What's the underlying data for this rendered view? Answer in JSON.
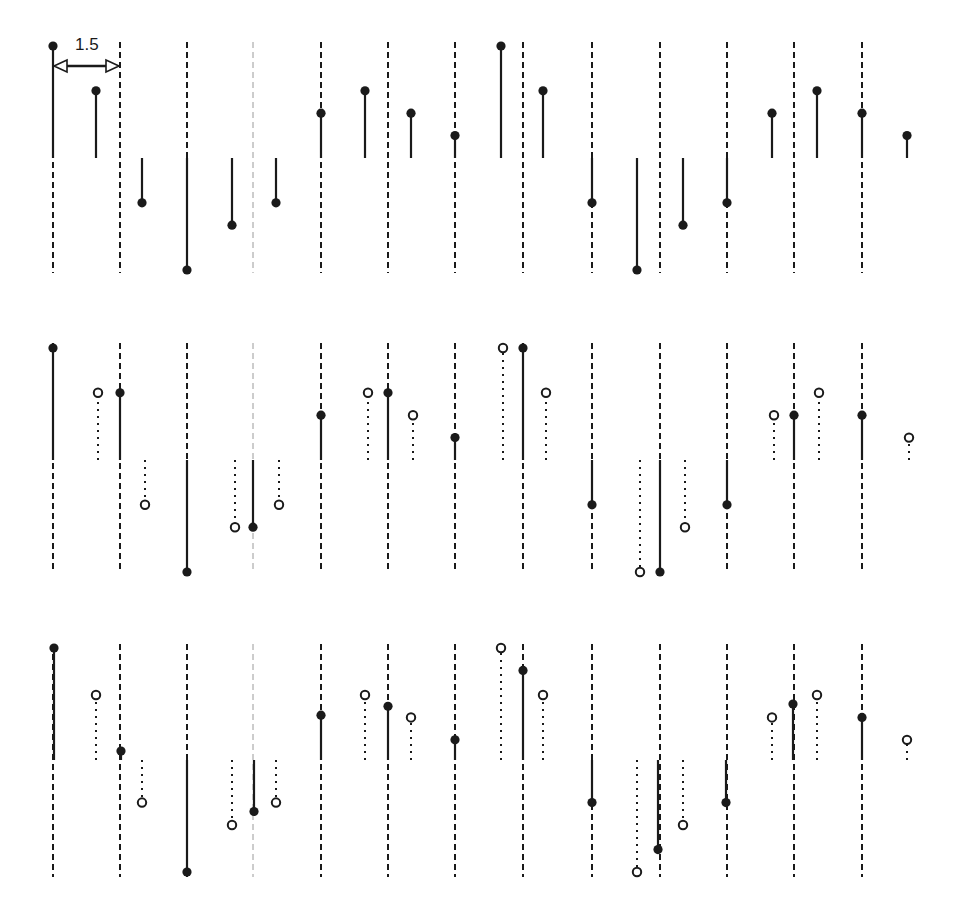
{
  "annotation": {
    "label": "1.5",
    "arrow": {
      "x1": 53,
      "x2": 120,
      "y": 66
    }
  },
  "layout": {
    "unit_px": 22.4,
    "stroke_color": "#1a1a1a",
    "grid_x": [
      53,
      120,
      187,
      253,
      321,
      388,
      455,
      523,
      592,
      660,
      727,
      794,
      862
    ],
    "light_grid_index": 3,
    "panels": [
      {
        "baseline": 158,
        "grid_top": 42,
        "grid_bottom": 273
      },
      {
        "baseline": 460,
        "grid_top": 343,
        "grid_bottom": 573
      },
      {
        "baseline": 760,
        "grid_top": 644,
        "grid_bottom": 877
      }
    ]
  },
  "chart_data": {
    "type": "stem",
    "title": "",
    "x_spacing_label": "1.5",
    "panels": [
      {
        "name": "panel-1",
        "filled": [
          {
            "x": 53,
            "v": 5
          },
          {
            "x": 96,
            "v": 3
          },
          {
            "x": 142,
            "v": -2
          },
          {
            "x": 187,
            "v": -5
          },
          {
            "x": 232,
            "v": -3
          },
          {
            "x": 276,
            "v": -2
          },
          {
            "x": 321,
            "v": 2
          },
          {
            "x": 365,
            "v": 3
          },
          {
            "x": 411,
            "v": 2
          },
          {
            "x": 455,
            "v": 1
          },
          {
            "x": 501,
            "v": 5
          },
          {
            "x": 543,
            "v": 3
          },
          {
            "x": 592,
            "v": -2
          },
          {
            "x": 637,
            "v": -5
          },
          {
            "x": 683,
            "v": -3
          },
          {
            "x": 727,
            "v": -2
          },
          {
            "x": 772,
            "v": 2
          },
          {
            "x": 817,
            "v": 3
          },
          {
            "x": 862,
            "v": 2
          },
          {
            "x": 907,
            "v": 1
          }
        ],
        "hollow": []
      },
      {
        "name": "panel-2",
        "filled": [
          {
            "x": 53,
            "v": 5
          },
          {
            "x": 120,
            "v": 3
          },
          {
            "x": 187,
            "v": -5
          },
          {
            "x": 253,
            "v": -3
          },
          {
            "x": 321,
            "v": 2
          },
          {
            "x": 388,
            "v": 3
          },
          {
            "x": 455,
            "v": 1
          },
          {
            "x": 523,
            "v": 5
          },
          {
            "x": 592,
            "v": -2
          },
          {
            "x": 660,
            "v": -5
          },
          {
            "x": 727,
            "v": -2
          },
          {
            "x": 794,
            "v": 2
          },
          {
            "x": 862,
            "v": 2
          }
        ],
        "hollow": [
          {
            "x": 98,
            "v": 3
          },
          {
            "x": 145,
            "v": -2
          },
          {
            "x": 235,
            "v": -3
          },
          {
            "x": 279,
            "v": -2
          },
          {
            "x": 368,
            "v": 3
          },
          {
            "x": 413,
            "v": 2
          },
          {
            "x": 503,
            "v": 5
          },
          {
            "x": 546,
            "v": 3
          },
          {
            "x": 640,
            "v": -5
          },
          {
            "x": 685,
            "v": -3
          },
          {
            "x": 774,
            "v": 2
          },
          {
            "x": 819,
            "v": 3
          },
          {
            "x": 909,
            "v": 1
          }
        ]
      },
      {
        "name": "panel-3",
        "filled": [
          {
            "x": 54,
            "v": 5
          },
          {
            "x": 121,
            "v": 0.4
          },
          {
            "x": 187,
            "v": -5
          },
          {
            "x": 254,
            "v": -2.3
          },
          {
            "x": 321,
            "v": 2
          },
          {
            "x": 388,
            "v": 2.4
          },
          {
            "x": 455,
            "v": 0.9
          },
          {
            "x": 523,
            "v": 4
          },
          {
            "x": 592,
            "v": -1.9
          },
          {
            "x": 658,
            "v": -4
          },
          {
            "x": 726,
            "v": -1.9
          },
          {
            "x": 793,
            "v": 2.5
          },
          {
            "x": 862,
            "v": 1.9
          }
        ],
        "hollow": [
          {
            "x": 96,
            "v": 2.9
          },
          {
            "x": 142,
            "v": -1.9
          },
          {
            "x": 232,
            "v": -2.9
          },
          {
            "x": 276,
            "v": -1.9
          },
          {
            "x": 365,
            "v": 2.9
          },
          {
            "x": 411,
            "v": 1.9
          },
          {
            "x": 501,
            "v": 5
          },
          {
            "x": 543,
            "v": 2.9
          },
          {
            "x": 637,
            "v": -5
          },
          {
            "x": 683,
            "v": -2.9
          },
          {
            "x": 772,
            "v": 1.9
          },
          {
            "x": 817,
            "v": 2.9
          },
          {
            "x": 907,
            "v": 0.9
          }
        ]
      }
    ]
  }
}
